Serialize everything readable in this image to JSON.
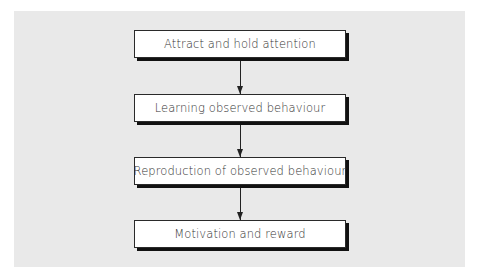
{
  "diagram": {
    "type": "flowchart",
    "direction": "top-to-bottom",
    "steps": [
      {
        "label": "Attract and hold attention"
      },
      {
        "label": "Learning observed behaviour"
      },
      {
        "label": "Reproduction of observed behaviour"
      },
      {
        "label": "Motivation and reward"
      }
    ],
    "edges": [
      {
        "from": 0,
        "to": 1
      },
      {
        "from": 1,
        "to": 2
      },
      {
        "from": 2,
        "to": 3
      }
    ],
    "colors": {
      "panel_background": "#e9e9e9",
      "box_fill": "#ffffff",
      "box_border": "#2a2a2a",
      "shadow": "#111111",
      "arrow": "#222222"
    }
  }
}
